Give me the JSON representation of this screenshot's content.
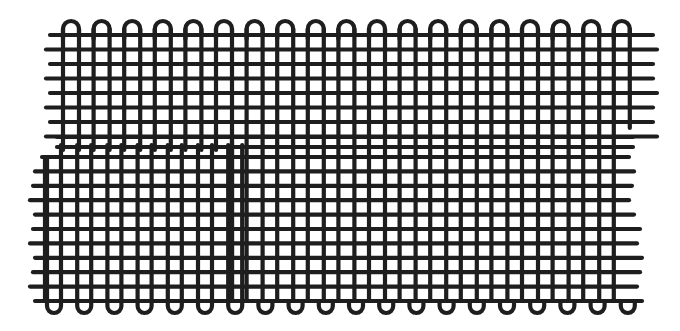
{
  "figure": {
    "ink_color": "#1e1e1e",
    "background": "#ffffff",
    "stroke_width": 4.2,
    "top_loops": {
      "y_line": 35,
      "y_peak": 21,
      "pairs_start_x": 63,
      "pair_width": 16,
      "pair_pitch": 30.6,
      "count": 19
    },
    "bottom_loops": {
      "y_line": 301,
      "y_peak": 313,
      "pairs_start_x": 47,
      "pair_width": 14,
      "pair_pitch": 30.2,
      "count": 20
    },
    "upper_rows": {
      "y_start": 35,
      "pitch": 14.5,
      "count": 8,
      "x_left": 50,
      "x_right": 653
    },
    "lower_rows": {
      "y_start": 157,
      "pitch": 14.4,
      "count": 11,
      "x_left": 33,
      "x_right": 640
    },
    "middle_rows": {
      "ys": [
        137,
        147
      ],
      "x_left": 57,
      "x_right": 633
    },
    "upper_right_step_x": 636,
    "upper_right_step_y": 128,
    "seam_x": 232,
    "seam_y_start": 137,
    "left_step_x": 45,
    "left_step_y": 157
  }
}
